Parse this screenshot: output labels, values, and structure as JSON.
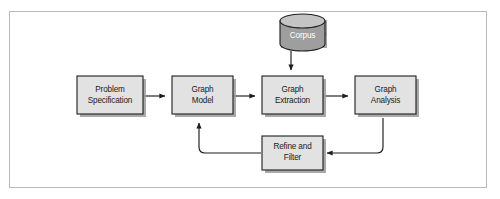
{
  "figure": {
    "type": "flowchart",
    "orientation": "left-to-right with feedback loops",
    "frame": {
      "border_color": "#b9b9b9",
      "background": "#ffffff"
    },
    "colors": {
      "box_fill": "#e2e2e2",
      "box_stroke": "#1d1d1d",
      "box_shadow": "#9a9a9a",
      "cylinder_fill": "#9e9e9e",
      "cylinder_top_fill": "#c4c4c4",
      "label_dark": "#1a1a1a",
      "label_light": "#ffffff",
      "line": "#1d1d1d"
    }
  },
  "nodes": [
    {
      "id": "problem-specification",
      "shape": "process-box",
      "label_line1": "Problem",
      "label_line2": "Specification",
      "label_full": "Problem Specification",
      "text_color": "#1a1a1a"
    },
    {
      "id": "graph-model",
      "shape": "process-box",
      "label_line1": "Graph",
      "label_line2": "Model",
      "label_full": "Graph Model",
      "text_color": "#1a1a1a"
    },
    {
      "id": "graph-extraction",
      "shape": "process-box",
      "label_line1": "Graph",
      "label_line2": "Extraction",
      "label_full": "Graph Extraction",
      "text_color": "#1a1a1a"
    },
    {
      "id": "graph-analysis",
      "shape": "process-box",
      "label_line1": "Graph",
      "label_line2": "Analysis",
      "label_full": "Graph Analysis",
      "text_color": "#1a1a1a"
    },
    {
      "id": "refine-and-filter",
      "shape": "process-box",
      "label_line1": "Refine and",
      "label_line2": "Filter",
      "label_full": "Refine and Filter",
      "text_color": "#1a1a1a"
    },
    {
      "id": "corpus",
      "shape": "cylinder-datastore",
      "label_line1": "Corpus",
      "label_line2": "",
      "label_full": "Corpus",
      "text_color": "#ffffff"
    }
  ],
  "edges": [
    {
      "id": "edge-problem-to-model",
      "from": "problem-specification",
      "to": "graph-model",
      "style": "straight-arrow",
      "direction": "right"
    },
    {
      "id": "edge-model-to-extraction",
      "from": "graph-model",
      "to": "graph-extraction",
      "style": "straight-arrow",
      "direction": "right"
    },
    {
      "id": "edge-extraction-to-analysis",
      "from": "graph-extraction",
      "to": "graph-analysis",
      "style": "straight-arrow",
      "direction": "right"
    },
    {
      "id": "edge-corpus-to-extraction",
      "from": "corpus",
      "to": "graph-extraction",
      "style": "straight-arrow",
      "direction": "down"
    },
    {
      "id": "edge-analysis-to-refine",
      "from": "graph-analysis",
      "to": "refine-and-filter",
      "style": "elbow-arrow",
      "direction": "down-then-left"
    },
    {
      "id": "edge-refine-to-model",
      "from": "refine-and-filter",
      "to": "graph-model",
      "style": "elbow-arrow",
      "direction": "left-then-up"
    }
  ]
}
